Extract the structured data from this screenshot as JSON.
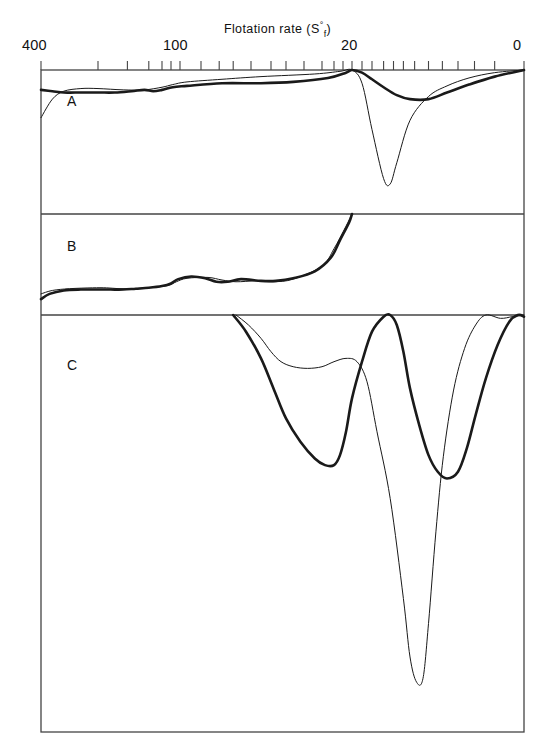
{
  "figure": {
    "axis_title_prefix": "Flotation  rate  (S",
    "axis_title_sup": "°",
    "axis_title_sub": "f",
    "axis_title_suffix": ")",
    "axis_title_plain": "Flotation rate (S°f)",
    "panels": [
      {
        "letter": "A"
      },
      {
        "letter": "B"
      },
      {
        "letter": "C"
      }
    ],
    "x_tick_labels": [
      {
        "text": "400",
        "x": 28
      },
      {
        "text": "100",
        "x": 167
      },
      {
        "text": "20",
        "x": 345
      },
      {
        "text": "0",
        "x": 516
      }
    ],
    "ink_color": "#1a1a1a",
    "frame_color": "#444444",
    "background": "#ffffff"
  },
  "chart_data": {
    "type": "line",
    "title": "Flotation rate (S°f)",
    "xlabel": "Flotation rate (S°f)",
    "ylabel": "",
    "xlim": [
      400,
      0
    ],
    "x_axis_reversed": true,
    "x_scale": "nonlinear-sedimentation",
    "grid": false,
    "legend": "none",
    "x_ticks_labeled": [
      400,
      100,
      20,
      0
    ],
    "x_minor_tick_count": 28,
    "panels": [
      {
        "label": "A",
        "series": [
          {
            "name": "thin-curve-A",
            "style": "thin",
            "description": "flat baseline then single deep narrow peak near S=14",
            "points": [
              [
                400,
                0.36
              ],
              [
                380,
                0.22
              ],
              [
                360,
                0.16
              ],
              [
                330,
                0.14
              ],
              [
                300,
                0.14
              ],
              [
                240,
                0.15
              ],
              [
                190,
                0.15
              ],
              [
                150,
                0.13
              ],
              [
                120,
                0.11
              ],
              [
                95,
                0.09
              ],
              [
                70,
                0.07
              ],
              [
                50,
                0.05
              ],
              [
                32,
                0.03
              ],
              [
                24,
                0.01
              ],
              [
                20,
                0.0
              ],
              [
                18,
                0.1
              ],
              [
                16,
                0.45
              ],
              [
                14,
                0.82
              ],
              [
                13,
                0.86
              ],
              [
                12,
                0.7
              ],
              [
                10,
                0.38
              ],
              [
                8,
                0.2
              ],
              [
                6,
                0.12
              ],
              [
                4,
                0.06
              ],
              [
                2,
                0.02
              ],
              [
                0,
                0.0
              ]
            ]
          },
          {
            "name": "thick-curve-A",
            "style": "thick",
            "description": "flat baseline then broad shallow peak near S=10",
            "points": [
              [
                400,
                0.15
              ],
              [
                380,
                0.16
              ],
              [
                360,
                0.17
              ],
              [
                340,
                0.17
              ],
              [
                300,
                0.17
              ],
              [
                260,
                0.17
              ],
              [
                220,
                0.16
              ],
              [
                190,
                0.15
              ],
              [
                170,
                0.16
              ],
              [
                150,
                0.15
              ],
              [
                120,
                0.13
              ],
              [
                95,
                0.12
              ],
              [
                70,
                0.1
              ],
              [
                50,
                0.1
              ],
              [
                38,
                0.09
              ],
              [
                28,
                0.06
              ],
              [
                22,
                0.02
              ],
              [
                20,
                0.0
              ],
              [
                18,
                0.02
              ],
              [
                16,
                0.07
              ],
              [
                14,
                0.13
              ],
              [
                12,
                0.19
              ],
              [
                10,
                0.22
              ],
              [
                8,
                0.22
              ],
              [
                6,
                0.17
              ],
              [
                4,
                0.11
              ],
              [
                2,
                0.05
              ],
              [
                0,
                0.0
              ]
            ]
          }
        ]
      },
      {
        "label": "B",
        "series": [
          {
            "name": "thin-curve-B",
            "style": "thin",
            "description": "low baseline with small bump near S=45, rising to zero at S=20",
            "points": [
              [
                400,
                0.92
              ],
              [
                380,
                0.88
              ],
              [
                350,
                0.86
              ],
              [
                310,
                0.85
              ],
              [
                280,
                0.85
              ],
              [
                250,
                0.86
              ],
              [
                220,
                0.86
              ],
              [
                190,
                0.85
              ],
              [
                160,
                0.84
              ],
              [
                130,
                0.82
              ],
              [
                110,
                0.78
              ],
              [
                95,
                0.74
              ],
              [
                80,
                0.73
              ],
              [
                70,
                0.76
              ],
              [
                60,
                0.78
              ],
              [
                52,
                0.77
              ],
              [
                45,
                0.78
              ],
              [
                38,
                0.75
              ],
              [
                30,
                0.6
              ],
              [
                26,
                0.4
              ],
              [
                22,
                0.14
              ],
              [
                20,
                0.0
              ]
            ]
          },
          {
            "name": "thick-curve-B",
            "style": "thick",
            "description": "same baseline, slower rise then steep climb to zero at S=20",
            "points": [
              [
                400,
                0.98
              ],
              [
                385,
                0.92
              ],
              [
                360,
                0.88
              ],
              [
                330,
                0.87
              ],
              [
                300,
                0.87
              ],
              [
                270,
                0.87
              ],
              [
                240,
                0.87
              ],
              [
                210,
                0.86
              ],
              [
                180,
                0.85
              ],
              [
                150,
                0.83
              ],
              [
                125,
                0.8
              ],
              [
                105,
                0.75
              ],
              [
                92,
                0.72
              ],
              [
                82,
                0.74
              ],
              [
                74,
                0.78
              ],
              [
                66,
                0.78
              ],
              [
                58,
                0.75
              ],
              [
                50,
                0.77
              ],
              [
                44,
                0.77
              ],
              [
                38,
                0.74
              ],
              [
                32,
                0.66
              ],
              [
                27,
                0.5
              ],
              [
                24,
                0.3
              ],
              [
                21,
                0.1
              ],
              [
                20,
                0.0
              ]
            ]
          }
        ]
      },
      {
        "label": "C",
        "series": [
          {
            "name": "thin-curve-C",
            "style": "thin",
            "description": "shallow plateau then extremely deep narrow spike near S=9",
            "points": [
              [
                60,
                0.0
              ],
              [
                55,
                0.06
              ],
              [
                50,
                0.14
              ],
              [
                46,
                0.22
              ],
              [
                42,
                0.28
              ],
              [
                38,
                0.31
              ],
              [
                34,
                0.32
              ],
              [
                30,
                0.31
              ],
              [
                26,
                0.28
              ],
              [
                22,
                0.26
              ],
              [
                19,
                0.28
              ],
              [
                17,
                0.4
              ],
              [
                15,
                0.7
              ],
              [
                13,
                1.1
              ],
              [
                11,
                1.7
              ],
              [
                10,
                2.05
              ],
              [
                9.3,
                2.2
              ],
              [
                8.6,
                2.18
              ],
              [
                8.0,
                1.85
              ],
              [
                7.2,
                1.3
              ],
              [
                6.4,
                0.85
              ],
              [
                5.4,
                0.45
              ],
              [
                4.4,
                0.2
              ],
              [
                3.4,
                0.06
              ],
              [
                2.6,
                0.0
              ],
              [
                1.6,
                0.02
              ],
              [
                0.8,
                0.01
              ],
              [
                0,
                0.0
              ]
            ]
          },
          {
            "name": "thick-curve-C",
            "style": "thick",
            "description": "two deep broad troughs near S=26 and S=6, peak back to zero at S=13",
            "points": [
              [
                62,
                0.0
              ],
              [
                56,
                0.1
              ],
              [
                50,
                0.26
              ],
              [
                45,
                0.44
              ],
              [
                40,
                0.62
              ],
              [
                36,
                0.76
              ],
              [
                32,
                0.86
              ],
              [
                29,
                0.9
              ],
              [
                26,
                0.9
              ],
              [
                24,
                0.84
              ],
              [
                22,
                0.7
              ],
              [
                20,
                0.5
              ],
              [
                18,
                0.28
              ],
              [
                16,
                0.1
              ],
              [
                14,
                0.01
              ],
              [
                13,
                0.0
              ],
              [
                12,
                0.06
              ],
              [
                11,
                0.22
              ],
              [
                10,
                0.44
              ],
              [
                9,
                0.66
              ],
              [
                8,
                0.84
              ],
              [
                7,
                0.94
              ],
              [
                6,
                0.98
              ],
              [
                5,
                0.94
              ],
              [
                4.2,
                0.8
              ],
              [
                3.4,
                0.6
              ],
              [
                2.6,
                0.38
              ],
              [
                1.8,
                0.18
              ],
              [
                1.0,
                0.04
              ],
              [
                0.4,
                0.0
              ],
              [
                0,
                0.01
              ]
            ]
          }
        ]
      }
    ]
  }
}
